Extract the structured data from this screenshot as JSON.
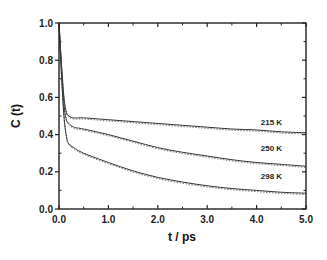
{
  "chart_data": {
    "type": "line",
    "title": "",
    "xlabel": "t / ps",
    "ylabel": "C (t)",
    "xlim": [
      0.0,
      5.0
    ],
    "ylim": [
      0.0,
      1.0
    ],
    "xticks": [
      "0.0",
      "1.0",
      "2.0",
      "3.0",
      "4.0",
      "5.0"
    ],
    "yticks": [
      "0.0",
      "0.2",
      "0.4",
      "0.6",
      "0.8",
      "1.0"
    ],
    "grid": false,
    "legend": "inline labels at right",
    "x": [
      0.0,
      0.05,
      0.1,
      0.15,
      0.2,
      0.3,
      0.5,
      1.0,
      1.5,
      2.0,
      2.5,
      3.0,
      3.5,
      4.0,
      4.5,
      5.0
    ],
    "series": [
      {
        "name": "215 K",
        "style": "solid (simulation) with dotted fit",
        "values": [
          1.0,
          0.78,
          0.6,
          0.52,
          0.5,
          0.49,
          0.49,
          0.48,
          0.47,
          0.46,
          0.45,
          0.44,
          0.43,
          0.425,
          0.415,
          0.41
        ]
      },
      {
        "name": "250 K",
        "style": "solid (simulation) with dotted fit",
        "values": [
          1.0,
          0.76,
          0.56,
          0.48,
          0.46,
          0.44,
          0.43,
          0.4,
          0.365,
          0.33,
          0.305,
          0.285,
          0.265,
          0.25,
          0.24,
          0.23
        ]
      },
      {
        "name": "298 K",
        "style": "solid (simulation) with dotted fit",
        "values": [
          1.0,
          0.72,
          0.5,
          0.39,
          0.35,
          0.33,
          0.3,
          0.25,
          0.205,
          0.17,
          0.145,
          0.125,
          0.11,
          0.1,
          0.09,
          0.085
        ]
      }
    ],
    "annotations": [
      {
        "text": "215 K",
        "x": 4.3,
        "y": 0.47
      },
      {
        "text": "250 K",
        "x": 4.3,
        "y": 0.33
      },
      {
        "text": "298 K",
        "x": 4.3,
        "y": 0.18
      }
    ]
  }
}
